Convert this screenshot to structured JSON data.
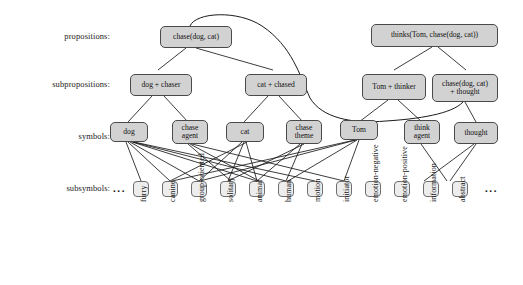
{
  "figure": {
    "rows": [
      {
        "name": "propositions",
        "label": "propositions:"
      },
      {
        "name": "subpropositions",
        "label": "subpropositions:"
      },
      {
        "name": "symbols",
        "label": "symbols:"
      },
      {
        "name": "subsymbols",
        "label": "subsymbols:"
      }
    ],
    "ellipsis_left": "...",
    "ellipsis_right": "...",
    "colors": {
      "node_fill": "#d2d2d2",
      "node_border": "#4a4a4a",
      "subsymbol_fill": "#ededed",
      "subsymbol_border": "#6e6e6e",
      "edge": "#1a1a1a",
      "background": "#ffffff"
    }
  },
  "propositions": [
    {
      "id": "p_chase",
      "label": "chase(dog, cat)"
    },
    {
      "id": "p_thinks",
      "label": "thinks(Tom, chase(dog, cat))"
    }
  ],
  "subpropositions": [
    {
      "id": "sp_dog_chaser",
      "label": "dog + chaser"
    },
    {
      "id": "sp_cat_chased",
      "label": "cat + chased"
    },
    {
      "id": "sp_tom_thinker",
      "label": "Tom + thinker"
    },
    {
      "id": "sp_chase_thought",
      "label": "chase(dog, cat)\n+ thought"
    }
  ],
  "symbols": [
    {
      "id": "s_dog",
      "label": "dog"
    },
    {
      "id": "s_chase_agent",
      "label": "chase\nagent"
    },
    {
      "id": "s_cat",
      "label": "cat"
    },
    {
      "id": "s_chase_theme",
      "label": "chase\ntheme"
    },
    {
      "id": "s_tom",
      "label": "Tom"
    },
    {
      "id": "s_think_agent",
      "label": "think\nagent"
    },
    {
      "id": "s_thought",
      "label": "thought"
    }
  ],
  "subsymbols": [
    {
      "id": "ss_furry",
      "label": "furry"
    },
    {
      "id": "ss_canine",
      "label": "canine"
    },
    {
      "id": "ss_group_oriented",
      "label": "group-oriented"
    },
    {
      "id": "ss_solitary",
      "label": "solitary"
    },
    {
      "id": "ss_animal",
      "label": "animal"
    },
    {
      "id": "ss_human",
      "label": "human"
    },
    {
      "id": "ss_motion",
      "label": "motion"
    },
    {
      "id": "ss_initiator",
      "label": "initiator"
    },
    {
      "id": "ss_emotion_negative",
      "label": "emotion-negative"
    },
    {
      "id": "ss_emotion_positive",
      "label": "emotion-positive"
    },
    {
      "id": "ss_information",
      "label": "information"
    },
    {
      "id": "ss_abstract",
      "label": "abstract"
    }
  ]
}
